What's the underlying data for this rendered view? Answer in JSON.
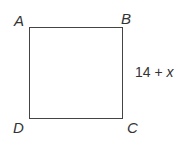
{
  "diagram": {
    "shape": "square",
    "vertices": {
      "top_left": "A",
      "top_right": "B",
      "bottom_right": "C",
      "bottom_left": "D"
    },
    "side_label": {
      "side": "BC",
      "constant": "14",
      "operator": "+",
      "variable": "x"
    },
    "colors": {
      "stroke": "#444444",
      "text": "#333333",
      "background": "#ffffff"
    }
  }
}
